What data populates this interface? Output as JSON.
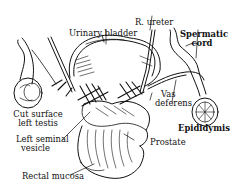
{
  "diagram": {
    "type": "anatomical-illustration",
    "style": "black-and-white line drawing",
    "colors": {
      "ink": "#111111",
      "background": "#ffffff"
    },
    "labels": [
      {
        "id": "urinary-bladder",
        "text": "Urinary bladder"
      },
      {
        "id": "r-ureter",
        "text": "R. ureter"
      },
      {
        "id": "spermatic-cord",
        "lines": [
          "Spermatic",
          "cord"
        ]
      },
      {
        "id": "vas-deferens",
        "lines": [
          "Vas",
          "deferens"
        ]
      },
      {
        "id": "cut-surface-left-testis",
        "lines": [
          "Cut surface",
          "left testis"
        ]
      },
      {
        "id": "epididymis",
        "text": "Epididymis"
      },
      {
        "id": "left-seminal-vesicle",
        "lines": [
          "Left seminal",
          "vesicle"
        ]
      },
      {
        "id": "prostate",
        "text": "Prostate"
      },
      {
        "id": "rectal-mucosa",
        "text": "Rectal mucosa"
      }
    ]
  }
}
